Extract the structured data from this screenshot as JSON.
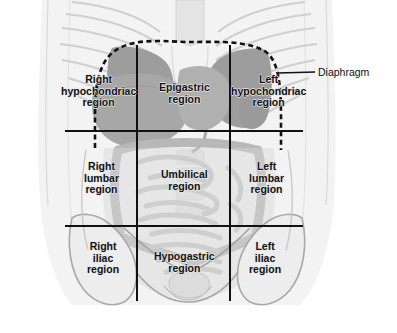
{
  "figure": {
    "background_color": "#ffffff",
    "body_fill": "#f2f2f2",
    "organ_light": "#d8d8d8",
    "organ_mid": "#c2c2c2",
    "organ_dark": "#9d9d9d",
    "line_color": "#111111",
    "outline_color": "#8f8f8f"
  },
  "callouts": [
    {
      "name": "diaphragm",
      "label": "Diaphragm",
      "label_x": 318,
      "label_y": 66,
      "leader_from_x": 278,
      "leader_from_y": 73,
      "leader_to_x": 315,
      "leader_to_y": 72
    }
  ],
  "regions": [
    {
      "id": "right-hypochondriac",
      "label": "Right\nhypochondriac\nregion",
      "row": "upper",
      "column": "right",
      "center_x": 98,
      "center_y": 91
    },
    {
      "id": "epigastric",
      "label": "Epigastric\nregion",
      "row": "upper",
      "column": "center",
      "center_x": 184,
      "center_y": 93
    },
    {
      "id": "left-hypochondriac",
      "label": "Left\nhypochondriac\nregion",
      "row": "upper",
      "column": "left",
      "center_x": 268,
      "center_y": 91
    },
    {
      "id": "right-lumbar",
      "label": "Right\nlumbar\nregion",
      "row": "middle",
      "column": "right",
      "center_x": 101,
      "center_y": 178
    },
    {
      "id": "umbilical",
      "label": "Umbilical\nregion",
      "row": "middle",
      "column": "center",
      "center_x": 184,
      "center_y": 180
    },
    {
      "id": "left-lumbar",
      "label": "Left\nlumbar\nregion",
      "row": "middle",
      "column": "left",
      "center_x": 266,
      "center_y": 178
    },
    {
      "id": "right-iliac",
      "label": "Right\niliac\nregion",
      "row": "lower",
      "column": "right",
      "center_x": 103,
      "center_y": 258
    },
    {
      "id": "hypogastric",
      "label": "Hypogastric\nregion",
      "row": "lower",
      "column": "center",
      "center_x": 184,
      "center_y": 262
    },
    {
      "id": "left-iliac",
      "label": "Left\niliac\nregion",
      "row": "lower",
      "column": "left",
      "center_x": 265,
      "center_y": 258
    }
  ],
  "grid": {
    "vertical_lines": [
      {
        "name": "right-midclavicular-line",
        "x": 137,
        "y1": 45,
        "y2": 301
      },
      {
        "name": "left-midclavicular-line",
        "x": 230,
        "y1": 45,
        "y2": 301
      }
    ],
    "horizontal_lines": [
      {
        "name": "subcostal-plane",
        "y": 131,
        "x1": 65,
        "x2": 303
      },
      {
        "name": "intertubercular-plane",
        "y": 226,
        "x1": 65,
        "x2": 303
      }
    ],
    "line_width": 2.0
  },
  "diaphragm_outline": {
    "name": "diaphragm-dashed-outline",
    "dash_pattern": "5,3.5",
    "stroke_width": 2.6,
    "path": "M 95 148 L 95 118 C 95 92 97 66 112 53 C 132 36 168 42 190 42 C 216 42 248 40 266 52 C 280 62 281 92 281 118 L 281 150"
  }
}
